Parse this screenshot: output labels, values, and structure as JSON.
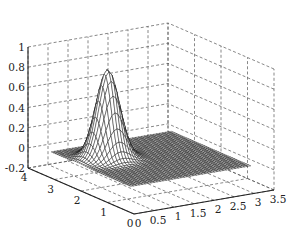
{
  "chart_data": {
    "type": "surface3d",
    "title": "",
    "xlabel": "",
    "ylabel": "",
    "zlabel": "",
    "x_ticks": [
      "0",
      "0.5",
      "1",
      "1.5",
      "2",
      "2.5",
      "3",
      "3.5"
    ],
    "y_ticks": [
      "0",
      "1",
      "2",
      "3",
      "4"
    ],
    "z_ticks": [
      "-0.2",
      "0",
      "0.2",
      "0.4",
      "0.6",
      "0.8",
      "1"
    ],
    "xlim": [
      0,
      3.5
    ],
    "ylim": [
      0,
      4
    ],
    "zlim": [
      -0.2,
      1
    ],
    "grid": true,
    "surface": {
      "function": "gaussian",
      "domain_x": [
        0.25,
        3.25
      ],
      "domain_y": [
        0.5,
        3.5
      ],
      "center_x": 1.0,
      "center_y": 2.5,
      "peak_z": 0.88,
      "sigma": 0.25,
      "mesh_resolution": 40,
      "edge_color": "#111111",
      "face_color": "#ffffff"
    }
  }
}
